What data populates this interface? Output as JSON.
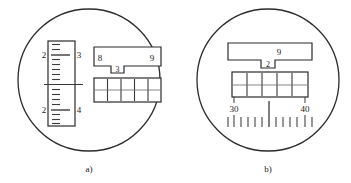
{
  "figure": {
    "type": "technical-illustration",
    "background_color": "#ffffff",
    "line_color": "#2b2b2b",
    "text_color": "#1a1a1a",
    "panels": [
      {
        "id": "a",
        "caption": "a)",
        "circle": {
          "cx": 89,
          "cy": 80,
          "r": 71
        },
        "vertical_scale": {
          "name": "vertical-ruler",
          "x": 48,
          "y": 41,
          "width": 27,
          "height": 85,
          "major_ticks": [
            {
              "left_label": "2",
              "right_label": "3",
              "position_pct": 17
            },
            {
              "left_label": "",
              "right_label": "",
              "position_pct": 52
            },
            {
              "left_label": "2",
              "right_label": "4",
              "position_pct": 84
            }
          ],
          "minor_tick_count": 16
        },
        "upper_bar": {
          "name": "upper-index-bar",
          "x": 94,
          "y": 47,
          "width": 67,
          "height": 19,
          "left_label": "8",
          "right_label": "9",
          "notch_label": "3"
        },
        "lower_bar": {
          "name": "lower-scale-bar",
          "x": 94,
          "y": 78,
          "width": 67,
          "height": 24,
          "internal_tick_count": 4,
          "has_midline": true
        }
      },
      {
        "id": "b",
        "caption": "b)",
        "circle": {
          "cx": 268,
          "cy": 80,
          "r": 71
        },
        "upper_bar": {
          "name": "upper-index-bar",
          "x": 228,
          "y": 43,
          "width": 84,
          "height": 17,
          "center_label": "9",
          "notch_label": "2"
        },
        "lower_bar": {
          "name": "lower-scale-bar",
          "x": 232,
          "y": 72,
          "width": 76,
          "height": 25,
          "internal_tick_count": 4,
          "has_midline": true
        },
        "horizontal_scale": {
          "name": "horizontal-ruler",
          "left_label": "30",
          "right_label": "40",
          "left_x": 234,
          "right_x": 305,
          "baseline_y": 112,
          "tick_count": 13,
          "center_tick_index": 6,
          "pointer_marks": [
            {
              "x": 234,
              "label": ""
            },
            {
              "x": 305,
              "label": ""
            }
          ]
        }
      }
    ]
  }
}
